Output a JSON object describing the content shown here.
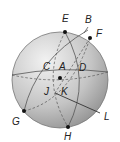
{
  "figure": {
    "type": "sphere-diagram",
    "sphere": {
      "cx": 60,
      "cy": 80,
      "r": 48,
      "fill_light": "#e6e6e6",
      "fill_dark": "#9e9e9e",
      "stroke": "#777777"
    },
    "points": [
      {
        "id": "E",
        "label": "E",
        "x": 65,
        "y": 32,
        "dot": true,
        "lx": 62,
        "ly": 22
      },
      {
        "id": "B",
        "label": "B",
        "lx": 86,
        "ly": 24,
        "dot": false
      },
      {
        "id": "F",
        "label": "F",
        "x": 90,
        "y": 38,
        "dot": true,
        "lx": 97,
        "ly": 36
      },
      {
        "id": "C",
        "label": "C",
        "lx": 44,
        "ly": 71,
        "dot": false
      },
      {
        "id": "A",
        "label": "A",
        "lx": 60,
        "ly": 71,
        "dot": false
      },
      {
        "id": "D",
        "label": "D",
        "lx": 79,
        "ly": 72,
        "dot": false
      },
      {
        "id": "center",
        "label": "",
        "x": 60,
        "y": 78,
        "dot": true
      },
      {
        "id": "J",
        "label": "J",
        "lx": 44,
        "ly": 95,
        "dot": false
      },
      {
        "id": "K",
        "label": "K",
        "lx": 62,
        "ly": 96,
        "dot": false
      },
      {
        "id": "G",
        "label": "G",
        "x": 24,
        "y": 111,
        "dot": true,
        "lx": 12,
        "ly": 125
      },
      {
        "id": "H",
        "label": "H",
        "x": 68,
        "y": 127,
        "dot": true,
        "lx": 64,
        "ly": 140
      },
      {
        "id": "L",
        "label": "L",
        "lx": 105,
        "ly": 120,
        "dot": false
      }
    ]
  }
}
